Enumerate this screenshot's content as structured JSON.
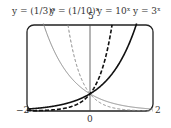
{
  "chart_data": {
    "type": "line",
    "title": "",
    "xlabel": "",
    "ylabel": "",
    "xlim": [
      -2,
      2
    ],
    "ylim": [
      0,
      5
    ],
    "x_ticks": [
      "-2",
      "0",
      "2"
    ],
    "y_ticks": [
      "5"
    ],
    "series": [
      {
        "name": "y = (1/3)^x",
        "style": "solid thin gray",
        "x": [
          -2,
          -1,
          0,
          1,
          2
        ],
        "values": [
          9,
          3,
          1,
          0.333,
          0.111
        ]
      },
      {
        "name": "y = (1/10)^x",
        "style": "dashed thin gray",
        "x": [
          -2,
          -1,
          0,
          1,
          2
        ],
        "values": [
          100,
          10,
          1,
          0.1,
          0.01
        ]
      },
      {
        "name": "y = 10^x",
        "style": "dashed thick black",
        "x": [
          -2,
          -1,
          0,
          1,
          2
        ],
        "values": [
          0.01,
          0.1,
          1,
          10,
          100
        ]
      },
      {
        "name": "y = 3^x",
        "style": "solid thick black",
        "x": [
          -2,
          -1,
          0,
          1,
          2
        ],
        "values": [
          0.111,
          0.333,
          1,
          3,
          9
        ]
      }
    ]
  },
  "labels": {
    "s1": "y = (1/3)ˣ",
    "s2": "y = (1/10)ˣ",
    "ymax": "5",
    "s3": "y = 10ˣ",
    "s4": "y = 3ˣ",
    "xmin": "−2",
    "xmax": "2",
    "xzero": "0"
  }
}
